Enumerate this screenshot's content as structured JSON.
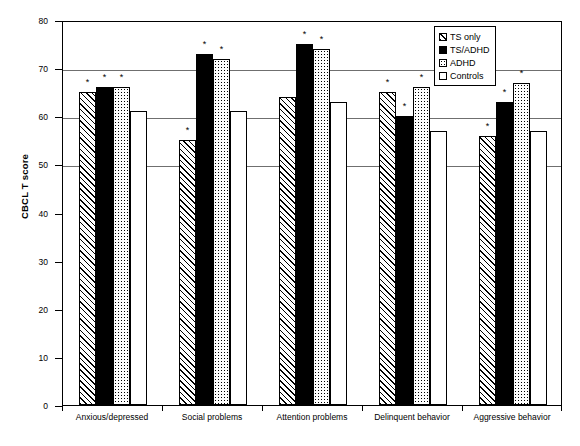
{
  "chart_data": {
    "type": "bar",
    "title": "",
    "xlabel": "",
    "ylabel": "CBCL T score",
    "ylim": [
      0,
      80
    ],
    "ytick_step": 10,
    "yticks": [
      0,
      10,
      20,
      30,
      40,
      50,
      60,
      70,
      80
    ],
    "grid": true,
    "gridlines_at": [
      50,
      60,
      70,
      80
    ],
    "legend_position": "top-right",
    "categories": [
      "Anxious/depressed",
      "Social problems",
      "Attention problems",
      "Delinquent behavior",
      "Aggressive behavior"
    ],
    "series": [
      {
        "name": "TS only",
        "pattern": "hatch",
        "values": [
          65,
          55,
          64,
          65,
          56
        ],
        "significant": [
          true,
          true,
          false,
          true,
          true
        ]
      },
      {
        "name": "TS/ADHD",
        "pattern": "solid-black",
        "values": [
          66,
          73,
          75,
          60,
          63
        ],
        "significant": [
          true,
          true,
          true,
          true,
          true
        ]
      },
      {
        "name": "ADHD",
        "pattern": "dots",
        "values": [
          66,
          72,
          74,
          66,
          67
        ],
        "significant": [
          true,
          true,
          true,
          true,
          true
        ]
      },
      {
        "name": "Controls",
        "pattern": "empty",
        "values": [
          61,
          61,
          63,
          57,
          57
        ],
        "significant": [
          false,
          false,
          false,
          false,
          false
        ]
      }
    ],
    "significance_marker": "*"
  },
  "legend": {
    "items": [
      {
        "label": "TS only",
        "pattern": "hatch"
      },
      {
        "label": "TS/ADHD",
        "pattern": "solid-black"
      },
      {
        "label": "ADHD",
        "pattern": "dots"
      },
      {
        "label": "Controls",
        "pattern": "empty"
      }
    ]
  },
  "axis": {
    "y_title": "CBCL T score",
    "y_tick_labels": [
      "0",
      "10",
      "20",
      "30",
      "40",
      "50",
      "60",
      "70",
      "80"
    ]
  }
}
